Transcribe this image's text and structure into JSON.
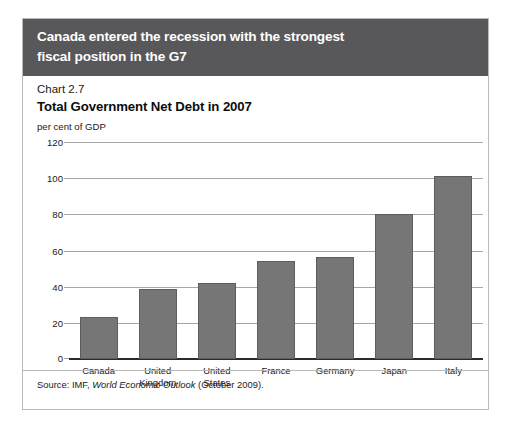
{
  "banner": {
    "headline": "Canada entered the recession with the strongest\nfiscal position in the G7"
  },
  "figure": {
    "chart_number": "Chart 2.7",
    "title": "Total Government Net Debt in 2007",
    "unit_label": "per cent of GDP",
    "source_prefix": "Source: IMF, ",
    "source_italic": "World Economic Outlook",
    "source_suffix": " (October 2009)."
  },
  "chart_data": {
    "type": "bar",
    "title": "Total Government Net Debt in 2007",
    "subtitle": "Chart 2.7",
    "xlabel": "",
    "ylabel": "per cent of GDP",
    "ylim": [
      0,
      120
    ],
    "yticks": [
      0,
      20,
      40,
      60,
      80,
      100,
      120
    ],
    "ytick_labels": [
      "0",
      "20",
      "40",
      "60",
      "80",
      "100",
      "120"
    ],
    "grid": true,
    "legend": false,
    "bar_color": "#767676",
    "categories": [
      "Canada",
      "United\nKingdom",
      "United\nStates",
      "France",
      "Germany",
      "Japan",
      "Italy"
    ],
    "values": [
      23.5,
      38.5,
      42,
      54,
      56.5,
      80,
      101
    ]
  },
  "colors": {
    "banner_background": "#58585a",
    "banner_text": "#ffffff",
    "bar_fill": "#767676",
    "bar_edge": "#5d5d5d",
    "gridline": "#a6a6a6",
    "axis_baseline": "#2b2b2b",
    "frame_border": "#b9b9b9",
    "page_background": "#ffffff"
  }
}
